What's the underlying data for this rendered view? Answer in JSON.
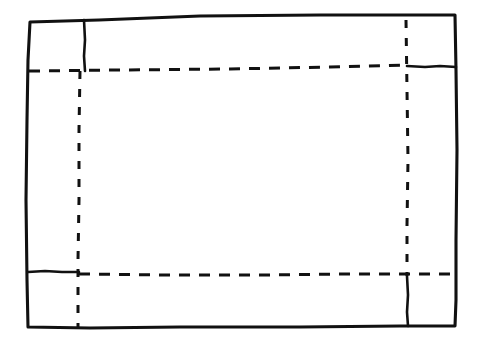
{
  "canvas": {
    "width": 481,
    "height": 347,
    "background_color": "#ffffff",
    "ink_color": "#111111",
    "title": "Hand-drawn layout wireframe sketch"
  },
  "style": {
    "border_stroke_width": 3.1,
    "inner_solid_stroke_width": 2.6,
    "dashed_stroke_width": 3.0,
    "dash_pattern_horizontal": "11 9",
    "dash_pattern_vertical": "8 10"
  },
  "shapes": {
    "outer_border": {
      "name": "outer-page-border",
      "kind": "solid-rectangle",
      "path": "M 30 22 L 99 20 L 200 16 L 320 15 L 400 15 L 455 15 L 456 70 L 457 150 L 456 240 L 456 300 L 455 326 L 400 326 L 300 327 L 180 327 L 90 328 L 28 327 L 27 280 L 26 200 L 27 120 L 28 60 Z"
    },
    "top_left_divider": {
      "name": "top-left-vertical-divider",
      "kind": "solid-line",
      "path": "M 84 20 L 85 40 L 84 56 L 85 71"
    },
    "top_horizontal_dashed": {
      "name": "top-horizontal-dashed-guide",
      "kind": "dashed-line",
      "path": "M 29 71 L 120 70 L 230 69 L 330 67 L 408 65"
    },
    "top_right_solid_segment": {
      "name": "top-right-horizontal-solid-segment",
      "kind": "solid-line",
      "path": "M 407 66 L 425 67 L 440 66 L 456 67"
    },
    "left_vertical_dashed": {
      "name": "left-vertical-dashed-guide",
      "kind": "dashed-line",
      "path": "M 80 71 L 79 130 L 79 200 L 78 260 L 78 327"
    },
    "right_vertical_dashed": {
      "name": "right-vertical-dashed-guide",
      "kind": "dashed-line",
      "path": "M 406 20 L 407 90 L 408 160 L 407 225 L 407 276"
    },
    "bottom_left_solid_segment": {
      "name": "bottom-left-horizontal-solid-segment",
      "kind": "solid-line",
      "path": "M 28 272 L 45 271 L 62 272 L 79 272"
    },
    "bottom_horizontal_dashed": {
      "name": "bottom-horizontal-dashed-guide",
      "kind": "dashed-line",
      "path": "M 79 274 L 170 275 L 260 275 L 350 274 L 456 274"
    },
    "bottom_right_solid_segment": {
      "name": "bottom-right-vertical-solid-segment",
      "kind": "solid-line",
      "path": "M 407 276 L 408 295 L 407 312 L 408 326"
    }
  },
  "regions": {
    "content_area": {
      "name": "central-content-region",
      "label": ""
    },
    "header_strip": {
      "name": "top-header-strip",
      "label": ""
    },
    "footer_strip": {
      "name": "bottom-footer-strip",
      "label": ""
    },
    "left_column": {
      "name": "left-sidebar-column",
      "label": ""
    },
    "right_column": {
      "name": "right-sidebar-column",
      "label": ""
    }
  }
}
